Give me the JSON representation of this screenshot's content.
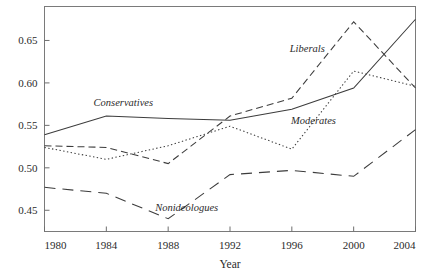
{
  "chart_data": {
    "type": "line",
    "title": "",
    "xlabel": "Year",
    "ylabel": "",
    "x": [
      1980,
      1984,
      1988,
      1992,
      1996,
      2000,
      2004
    ],
    "xlim": [
      1980,
      2004
    ],
    "ylim": [
      0.425,
      0.69
    ],
    "grid": false,
    "legend": "inline-labels",
    "xticks": [
      "1980",
      "1984",
      "1988",
      "1992",
      "1996",
      "2000",
      "2004"
    ],
    "yticks": [
      "0.45",
      "0.50",
      "0.55",
      "0.60",
      "0.65"
    ],
    "ytick_values": [
      0.45,
      0.5,
      0.55,
      0.6,
      0.65
    ],
    "series": [
      {
        "name": "Conservatives",
        "style": "solid",
        "label_x": 1985.1,
        "label_y": 0.573,
        "values": [
          0.539,
          0.561,
          0.558,
          0.556,
          0.569,
          0.594,
          0.675
        ]
      },
      {
        "name": "Liberals",
        "style": "dashed",
        "label_x": 1997.0,
        "label_y": 0.637,
        "values": [
          0.526,
          0.524,
          0.505,
          0.561,
          0.582,
          0.672,
          0.594
        ]
      },
      {
        "name": "Moderates",
        "style": "dotted",
        "label_x": 1997.4,
        "label_y": 0.552,
        "values": [
          0.524,
          0.51,
          0.526,
          0.549,
          0.522,
          0.614,
          0.596
        ]
      },
      {
        "name": "Nonideologues",
        "style": "long-dashed",
        "label_x": 1989.2,
        "label_y": 0.449,
        "values": [
          0.477,
          0.47,
          0.44,
          0.492,
          0.497,
          0.49,
          0.545
        ]
      }
    ]
  },
  "axis": {
    "x_title": "Year"
  },
  "colors": {
    "axis": "#6e6e6e",
    "line": "#3c3c3c",
    "text": "#2b2b2b"
  }
}
